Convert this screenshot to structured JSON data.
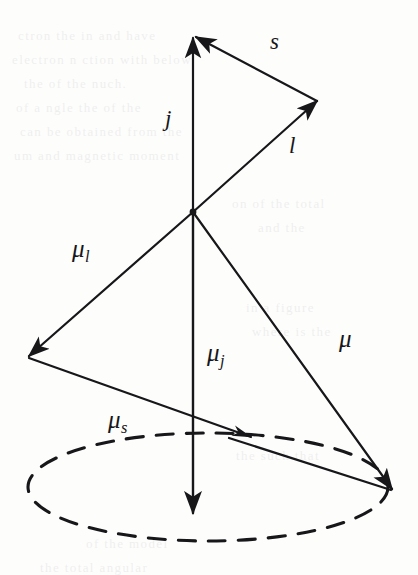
{
  "figure": {
    "background_color": "#fdfdfc",
    "ink_color": "#17171a",
    "origin": {
      "x": 193,
      "y": 212
    },
    "labels": [
      {
        "id": "s",
        "base": "s",
        "sub": "",
        "x": 270,
        "y": 30,
        "style": "plain"
      },
      {
        "id": "j",
        "base": "j",
        "sub": "",
        "x": 165,
        "y": 107,
        "style": "plain"
      },
      {
        "id": "l",
        "base": "l",
        "sub": "",
        "x": 289,
        "y": 134,
        "style": "plain"
      },
      {
        "id": "mu-l",
        "base": "μ",
        "sub": "l",
        "x": 72,
        "y": 236,
        "style": "greek"
      },
      {
        "id": "mu-j",
        "base": "μ",
        "sub": "j",
        "x": 207,
        "y": 340,
        "style": "greek"
      },
      {
        "id": "mu",
        "base": "μ",
        "sub": "",
        "x": 339,
        "y": 326,
        "style": "greek"
      },
      {
        "id": "mu-s",
        "base": "μ",
        "sub": "s",
        "x": 108,
        "y": 407,
        "style": "greek"
      }
    ],
    "vectors": [
      {
        "id": "j",
        "label": "j",
        "from": {
          "x": 193,
          "y": 212
        },
        "to": {
          "x": 193,
          "y": 38
        },
        "head": "large",
        "width": 2.2
      },
      {
        "id": "l",
        "label": "l",
        "from": {
          "x": 193,
          "y": 212
        },
        "to": {
          "x": 317,
          "y": 101
        },
        "head": "large",
        "width": 2.2
      },
      {
        "id": "s",
        "label": "s",
        "from": {
          "x": 317,
          "y": 101
        },
        "to": {
          "x": 196,
          "y": 37
        },
        "head": "large",
        "width": 2.2
      },
      {
        "id": "mu-j",
        "label": "μ j",
        "from": {
          "x": 193,
          "y": 212
        },
        "to": {
          "x": 193,
          "y": 513
        },
        "head": "large",
        "width": 2.4
      },
      {
        "id": "mu-l",
        "label": "μ l",
        "from": {
          "x": 193,
          "y": 212
        },
        "to": {
          "x": 29,
          "y": 356
        },
        "head": "large",
        "width": 2.2
      },
      {
        "id": "mu",
        "label": "μ",
        "from": {
          "x": 193,
          "y": 212
        },
        "to": {
          "x": 392,
          "y": 489
        },
        "head": "large",
        "width": 2.2
      },
      {
        "id": "mu-s",
        "label": "μ s",
        "from": {
          "x": 29,
          "y": 358
        },
        "to": {
          "x": 251,
          "y": 437
        },
        "head": "small",
        "width": 2.2
      },
      {
        "id": "mu-s-to-mu",
        "label": "μ s translated",
        "from": {
          "x": 229,
          "y": 438
        },
        "to": {
          "x": 391,
          "y": 490
        },
        "head": "none",
        "width": 2.2
      }
    ],
    "precession_orbit": {
      "id": "precession-ellipse",
      "center": {
        "x": 208,
        "y": 487
      },
      "rx": 180,
      "ry": 54,
      "style": "dashed",
      "dash_pattern": "17 13"
    },
    "scan_bleed_text": [
      {
        "text": "ctron  the   in   and  have",
        "x": 18,
        "y": 28
      },
      {
        "text": "electron   n   ction with  below",
        "x": 12,
        "y": 52
      },
      {
        "text": "the     of the     nuch.",
        "x": 24,
        "y": 76
      },
      {
        "text": "of a    ngle   the     of the",
        "x": 16,
        "y": 100
      },
      {
        "text": "can be obtained from the",
        "x": 20,
        "y": 124
      },
      {
        "text": "um and magnetic moment",
        "x": 14,
        "y": 148
      },
      {
        "text": "on of the   total",
        "x": 232,
        "y": 196
      },
      {
        "text": "and   the",
        "x": 258,
        "y": 220
      },
      {
        "text": "in   a   figure",
        "x": 246,
        "y": 300
      },
      {
        "text": "where   is the",
        "x": 252,
        "y": 324
      },
      {
        "text": "the   such   that",
        "x": 236,
        "y": 448
      },
      {
        "text": "of   the   model",
        "x": 86,
        "y": 536
      },
      {
        "text": "the   total   angular",
        "x": 40,
        "y": 560
      }
    ]
  }
}
